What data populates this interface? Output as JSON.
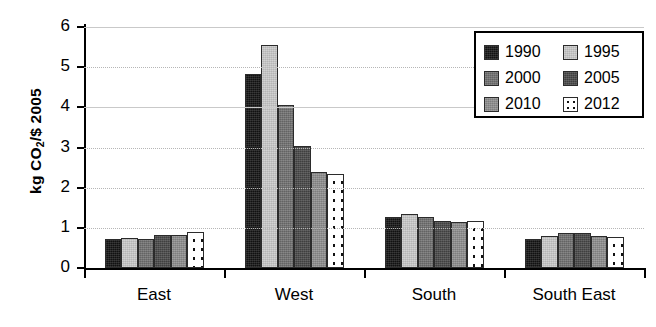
{
  "chart_data": {
    "type": "bar",
    "title": "",
    "xlabel": "",
    "ylabel": "kg CO2/$ 2005",
    "ylabel_prefix": "kg CO",
    "ylabel_sub": "2",
    "ylabel_suffix": "/$ 2005",
    "categories": [
      "East",
      "West",
      "South",
      "South East"
    ],
    "ylim": [
      0,
      6
    ],
    "yticks": [
      0,
      1,
      2,
      3,
      4,
      5,
      6
    ],
    "ytick_labels": [
      "0",
      "1",
      "2",
      "3",
      "4",
      "5",
      "6"
    ],
    "grid": true,
    "grid_axis": "y",
    "legend_position": "top-right",
    "series": [
      {
        "name": "1990",
        "color": "#131313",
        "values": [
          0.72,
          4.83,
          1.28,
          0.72
        ]
      },
      {
        "name": "1995",
        "color": "#cacaca",
        "values": [
          0.75,
          5.55,
          1.35,
          0.8
        ]
      },
      {
        "name": "2000",
        "color": "#6f6f6f",
        "values": [
          0.73,
          4.05,
          1.28,
          0.86
        ]
      },
      {
        "name": "2005",
        "color": "#474747",
        "values": [
          0.83,
          3.05,
          1.16,
          0.86
        ]
      },
      {
        "name": "2010",
        "color": "#8d8d8d",
        "values": [
          0.83,
          2.4,
          1.15,
          0.79
        ]
      },
      {
        "name": "2012",
        "color": "#ffffff",
        "pattern": "dotted",
        "values": [
          0.9,
          2.33,
          1.16,
          0.77
        ]
      }
    ]
  },
  "legend": {
    "entries": [
      {
        "label": "1990",
        "swatch": "legend-swatch-1990"
      },
      {
        "label": "1995",
        "swatch": "legend-swatch-1995"
      },
      {
        "label": "2000",
        "swatch": "legend-swatch-2000"
      },
      {
        "label": "2005",
        "swatch": "legend-swatch-2005"
      },
      {
        "label": "2010",
        "swatch": "legend-swatch-2010"
      },
      {
        "label": "2012",
        "swatch": "legend-swatch-2012"
      }
    ]
  }
}
